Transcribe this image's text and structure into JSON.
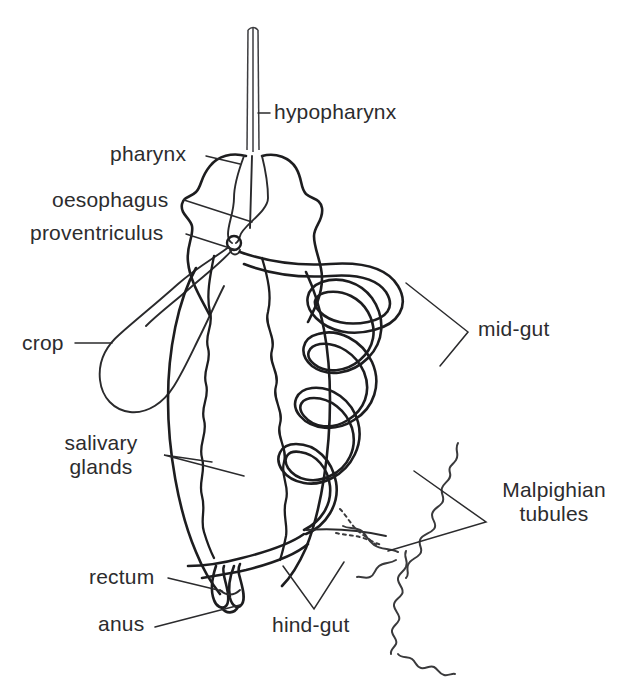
{
  "figure": {
    "background_color": "#ffffff",
    "ink_color": "#1d1d1f"
  },
  "labels": {
    "hypopharynx": "hypopharynx",
    "pharynx": "pharynx",
    "oesophagus": "oesophagus",
    "proventriculus": "proventriculus",
    "crop": "crop",
    "salivary_glands_line1": "salivary",
    "salivary_glands_line2": "glands",
    "mid_gut": "mid-gut",
    "malpighian_line1": "Malpighian",
    "malpighian_line2": "tubules",
    "rectum": "rectum",
    "anus": "anus",
    "hind_gut": "hind-gut"
  },
  "structures": [
    {
      "name": "hypopharynx",
      "description": "narrow vertical tube at top centre"
    },
    {
      "name": "pharynx",
      "description": "bulbous head chamber"
    },
    {
      "name": "oesophagus",
      "description": "tube running from pharynx to proventriculus"
    },
    {
      "name": "proventriculus",
      "description": "small round valve node"
    },
    {
      "name": "crop",
      "description": "pear-shaped sac on the left"
    },
    {
      "name": "salivary-glands",
      "description": "two wavy vertical glands inside body"
    },
    {
      "name": "mid-gut",
      "description": "serpentine coiled tube on the right"
    },
    {
      "name": "malpighian-tubules",
      "description": "thin beaded wiggly strands"
    },
    {
      "name": "hind-gut",
      "description": "tube sweeping from mid-gut to rectum"
    },
    {
      "name": "rectum",
      "description": "terminal chamber at body tip"
    },
    {
      "name": "anus",
      "description": "opening at the posterior tip"
    }
  ]
}
